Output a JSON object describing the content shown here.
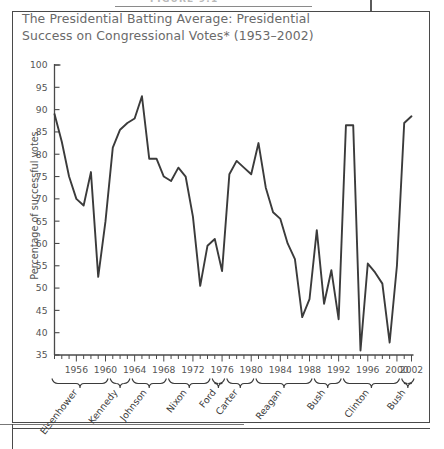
{
  "figure": {
    "caption_top": "FIGURE 9.1",
    "title": "The Presidential Batting Average: Presidential Success on Congressional Votes* (1953–2002)"
  },
  "chart_data": {
    "type": "line",
    "title": "The Presidential Batting Average: Presidential Success on Congressional Votes* (1953–2002)",
    "xlabel": "",
    "ylabel": "Percentage of successful votes",
    "ylim": [
      35,
      100
    ],
    "xlim": [
      1953,
      2002
    ],
    "yticks": [
      35,
      40,
      45,
      50,
      55,
      60,
      65,
      70,
      75,
      80,
      85,
      90,
      95,
      100
    ],
    "xticks": [
      1956,
      1960,
      1964,
      1968,
      1972,
      1976,
      1980,
      1984,
      1988,
      1992,
      1996,
      2000,
      2002
    ],
    "grid": false,
    "legend": "none",
    "line_color": "#3b3b3b",
    "x": [
      1953,
      1954,
      1955,
      1956,
      1957,
      1958,
      1959,
      1960,
      1961,
      1962,
      1963,
      1964,
      1965,
      1966,
      1967,
      1968,
      1969,
      1970,
      1971,
      1972,
      1973,
      1974,
      1975,
      1976,
      1977,
      1978,
      1979,
      1980,
      1981,
      1982,
      1983,
      1984,
      1985,
      1986,
      1987,
      1988,
      1989,
      1990,
      1991,
      1992,
      1993,
      1994,
      1995,
      1996,
      1997,
      1998,
      1999,
      2000,
      2001,
      2002
    ],
    "values": [
      89.0,
      82.8,
      75.0,
      70.0,
      68.5,
      76.0,
      52.5,
      65.0,
      81.5,
      85.5,
      87.0,
      88.0,
      93.0,
      79.0,
      79.0,
      75.0,
      74.0,
      77.0,
      75.0,
      66.0,
      50.5,
      59.5,
      61.0,
      53.8,
      75.5,
      78.5,
      77.0,
      75.5,
      82.5,
      72.5,
      67.0,
      65.5,
      60.0,
      56.5,
      43.5,
      47.5,
      63.0,
      46.5,
      54.0,
      43.0,
      86.5,
      86.5,
      36.0,
      55.5,
      53.5,
      51.0,
      37.8,
      55.0,
      87.0,
      88.5
    ],
    "president_terms": [
      {
        "name": "Eisenhower",
        "start": 1953,
        "end": 1960
      },
      {
        "name": "Kennedy",
        "start": 1961,
        "end": 1963
      },
      {
        "name": "Johnson",
        "start": 1964,
        "end": 1968
      },
      {
        "name": "Nixon",
        "start": 1969,
        "end": 1974
      },
      {
        "name": "Ford",
        "start": 1975,
        "end": 1976
      },
      {
        "name": "Carter",
        "start": 1977,
        "end": 1980
      },
      {
        "name": "Reagan",
        "start": 1981,
        "end": 1988
      },
      {
        "name": "Bush",
        "start": 1989,
        "end": 1992
      },
      {
        "name": "Clinton",
        "start": 1993,
        "end": 2000
      },
      {
        "name": "Bush",
        "start": 2001,
        "end": 2002
      }
    ]
  }
}
